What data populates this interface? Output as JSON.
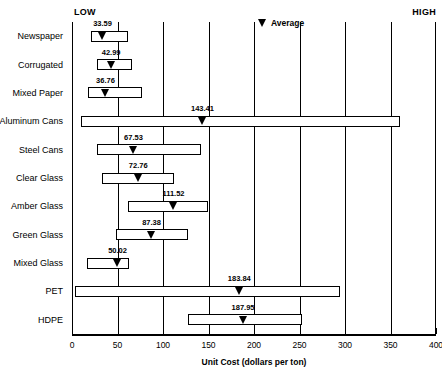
{
  "annotations": {
    "low": "LOW",
    "high": "HIGH"
  },
  "legend": {
    "label": "Average",
    "marker": "triangle-down-marker"
  },
  "chart_data": {
    "type": "bar",
    "title": "",
    "xlabel": "Unit Cost (dollars per ton)",
    "ylabel": "",
    "xlim": [
      0,
      400
    ],
    "xticks": [
      0,
      50,
      100,
      150,
      200,
      250,
      300,
      350,
      400
    ],
    "xticklabels": [
      "0",
      "50",
      "100",
      "150",
      "200",
      "250",
      "300",
      "350",
      "400"
    ],
    "grid": true,
    "grid_axis": "x",
    "legend_position": "top-right",
    "orientation": "horizontal",
    "value_label_key": "average",
    "categories": [
      "Newspaper",
      "Corrugated",
      "Mixed Paper",
      "Aluminum Cans",
      "Steel Cans",
      "Clear Glass",
      "Amber Glass",
      "Green Glass",
      "Mixed Glass",
      "PET",
      "HDPE"
    ],
    "series": [
      {
        "name": "Average",
        "values": [
          33.59,
          42.99,
          36.76,
          143.41,
          67.53,
          72.76,
          111.52,
          87.38,
          50.02,
          183.84,
          187.95
        ]
      },
      {
        "name": "Low",
        "values": [
          21,
          27,
          18,
          10,
          27,
          33,
          62,
          48,
          17,
          3,
          128
        ]
      },
      {
        "name": "High",
        "values": [
          62,
          66,
          77,
          360,
          142,
          112,
          150,
          128,
          63,
          295,
          253
        ]
      }
    ],
    "rows": [
      {
        "category": "Newspaper",
        "low": 21,
        "high": 62,
        "average": 33.59,
        "average_label": "33.59"
      },
      {
        "category": "Corrugated",
        "low": 27,
        "high": 66,
        "average": 42.99,
        "average_label": "42.99"
      },
      {
        "category": "Mixed Paper",
        "low": 18,
        "high": 77,
        "average": 36.76,
        "average_label": "36.76"
      },
      {
        "category": "Aluminum Cans",
        "low": 10,
        "high": 360,
        "average": 143.41,
        "average_label": "143.41"
      },
      {
        "category": "Steel Cans",
        "low": 27,
        "high": 142,
        "average": 67.53,
        "average_label": "67.53"
      },
      {
        "category": "Clear Glass",
        "low": 33,
        "high": 112,
        "average": 72.76,
        "average_label": "72.76"
      },
      {
        "category": "Amber Glass",
        "low": 62,
        "high": 150,
        "average": 111.52,
        "average_label": "111.52"
      },
      {
        "category": "Green Glass",
        "low": 48,
        "high": 128,
        "average": 87.38,
        "average_label": "87.38"
      },
      {
        "category": "Mixed Glass",
        "low": 17,
        "high": 63,
        "average": 50.02,
        "average_label": "50.02"
      },
      {
        "category": "PET",
        "low": 3,
        "high": 295,
        "average": 183.84,
        "average_label": "183.84"
      },
      {
        "category": "HDPE",
        "low": 128,
        "high": 253,
        "average": 187.95,
        "average_label": "187.95"
      }
    ]
  },
  "colors": {
    "ink": "#000000",
    "background": "#ffffff"
  }
}
